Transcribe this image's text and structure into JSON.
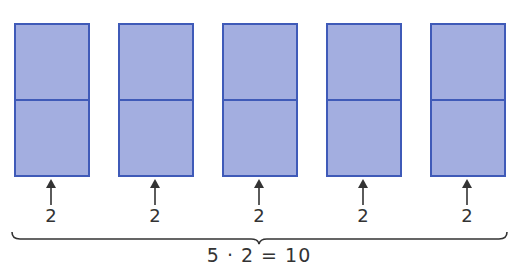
{
  "diagram": {
    "type": "multiplication-grouping",
    "colors": {
      "fill": "#a3aee0",
      "stroke": "#3f5ab8",
      "text": "#333333"
    },
    "groups": [
      {
        "cells": 2,
        "label": "2"
      },
      {
        "cells": 2,
        "label": "2"
      },
      {
        "cells": 2,
        "label": "2"
      },
      {
        "cells": 2,
        "label": "2"
      },
      {
        "cells": 2,
        "label": "2"
      }
    ],
    "equation": "5 · 2 = 10"
  }
}
